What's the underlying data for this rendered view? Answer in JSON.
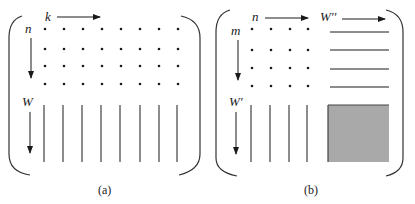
{
  "figure": {
    "panel_a": {
      "caption": "(a)",
      "top_label": "k",
      "left_top_label": "n",
      "left_bottom_label": "W",
      "dot_grid": {
        "columns": 8,
        "rows": 4
      },
      "vertical_lines": 8
    },
    "panel_b": {
      "caption": "(b)",
      "top_left_label": "n",
      "top_right_label": "W''",
      "left_top_label": "m",
      "left_bottom_label": "W'",
      "dot_grid": {
        "columns": 4,
        "rows": 4
      },
      "horizontal_lines": 4,
      "vertical_lines": 4,
      "shaded_block_color": "#a9a9a9"
    }
  },
  "colors": {
    "ink": "#1a1a1a",
    "bracket": "#333333",
    "shade": "#a9a9a9",
    "shade_border": "#444444",
    "background": "#ffffff"
  }
}
